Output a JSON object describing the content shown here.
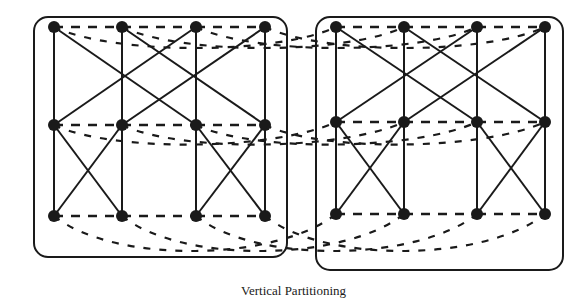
{
  "caption": "Vertical Partitioning",
  "colors": {
    "ink": "#1a1a1a",
    "background": "#ffffff"
  },
  "partitions": [
    {
      "name": "left-partition",
      "box": {
        "x": 34,
        "y": 17,
        "w": 253,
        "h": 240,
        "r": 14
      },
      "cols": [
        54,
        122,
        196,
        265
      ],
      "rows": [
        27,
        125,
        216
      ]
    },
    {
      "name": "right-partition",
      "box": {
        "x": 316,
        "y": 17,
        "w": 247,
        "h": 253,
        "r": 14
      },
      "cols": [
        336,
        404,
        477,
        545
      ],
      "rows": [
        27,
        122,
        214
      ]
    }
  ],
  "node_radius": 6,
  "solid_edges": {
    "stage1_pairs": [
      [
        0,
        2
      ],
      [
        1,
        3
      ],
      [
        2,
        0
      ],
      [
        3,
        1
      ]
    ],
    "stage2_pairs": [
      [
        0,
        1
      ],
      [
        1,
        0
      ],
      [
        2,
        3
      ],
      [
        3,
        2
      ]
    ]
  },
  "dashed_edges_description": "Dashed edges connect nodes within each row and cross between partitions (inter-partition communication)"
}
